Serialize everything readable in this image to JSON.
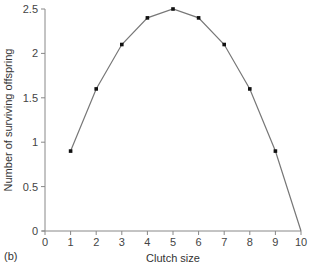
{
  "panel_label": "(b)",
  "chart_data": {
    "type": "line",
    "title": "",
    "xlabel": "Clutch size",
    "ylabel": "Number of surviving offspring",
    "x": [
      1,
      2,
      3,
      4,
      5,
      6,
      7,
      8,
      9,
      10
    ],
    "series": [
      {
        "name": "surviving offspring",
        "values": [
          0.9,
          1.6,
          2.1,
          2.4,
          2.5,
          2.4,
          2.1,
          1.6,
          0.9,
          0
        ],
        "markers": [
          true,
          true,
          true,
          true,
          true,
          true,
          true,
          true,
          true,
          false
        ]
      }
    ],
    "xlim": [
      0,
      10
    ],
    "ylim": [
      0,
      2.5
    ],
    "xticks": [
      "0",
      "1",
      "2",
      "3",
      "4",
      "5",
      "6",
      "7",
      "8",
      "9",
      "10"
    ],
    "yticks": [
      "0",
      "0.5",
      "1",
      "1.5",
      "2",
      "2.5"
    ],
    "grid": false,
    "legend": "none",
    "colors": {
      "line": "#777777",
      "marker": "#111111",
      "axis": "#888888"
    }
  }
}
